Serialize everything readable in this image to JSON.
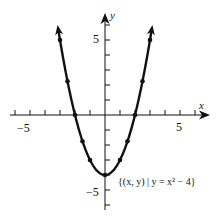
{
  "chart_data": {
    "type": "line",
    "title": "",
    "function": "y = x^2 - 4",
    "xlabel": "x",
    "ylabel": "y",
    "x_tick_labels": [
      "-5",
      "5"
    ],
    "y_tick_labels": [
      "5",
      "-5"
    ],
    "xlim": [
      -6.5,
      7
    ],
    "ylim": [
      -6,
      7
    ],
    "grid": false,
    "annotation": "{(x, y) | y = x² − 4}",
    "points": [
      {
        "x": -3,
        "y": 5
      },
      {
        "x": -2.5,
        "y": 2.25
      },
      {
        "x": -2,
        "y": 0
      },
      {
        "x": -1.5,
        "y": -1.75
      },
      {
        "x": -1,
        "y": -3
      },
      {
        "x": 0,
        "y": -4
      },
      {
        "x": 1,
        "y": -3
      },
      {
        "x": 1.5,
        "y": -1.75
      },
      {
        "x": 2,
        "y": 0
      },
      {
        "x": 2.5,
        "y": 2.25
      },
      {
        "x": 3,
        "y": 5
      }
    ],
    "curve_arrows": "both ends extend upward"
  },
  "labels": {
    "x_axis": "x",
    "y_axis": "y",
    "x_neg5": "−5",
    "x_pos5": "5",
    "y_pos5": "5",
    "y_neg5": "−5",
    "annotation": "{(x, y) | y = x² − 4}"
  }
}
